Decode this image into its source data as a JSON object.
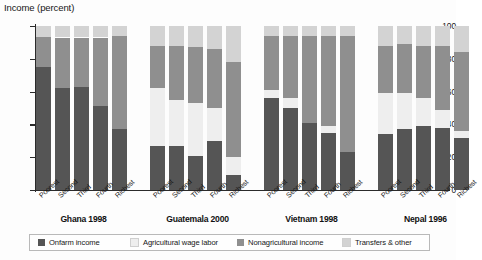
{
  "chart_data": {
    "type": "bar",
    "subtype": "stacked-bar-100pct-grouped",
    "title": "Income (percent)",
    "ylabel": "Income (percent)",
    "xlabel": "",
    "ylim": [
      0,
      100
    ],
    "yticks": [
      0,
      20,
      40,
      60,
      80,
      100
    ],
    "grid": false,
    "legend_position": "bottom",
    "categories": [
      "Poorest",
      "Second",
      "Third",
      "Fourth",
      "Richest"
    ],
    "series": [
      {
        "name": "Onfarm income",
        "color": "#555555"
      },
      {
        "name": "Agricultural wage labor",
        "color": "#eeeeee"
      },
      {
        "name": "Nonagricultural income",
        "color": "#8f8f8f"
      },
      {
        "name": "Transfers & other",
        "color": "#d3d3d3"
      }
    ],
    "groups": [
      {
        "name": "Ghana 1998",
        "bars": [
          {
            "category": "Poorest",
            "values": [
              75,
              0,
              18,
              7
            ]
          },
          {
            "category": "Second",
            "values": [
              62,
              0,
              31,
              7
            ]
          },
          {
            "category": "Third",
            "values": [
              63,
              0,
              30,
              7
            ]
          },
          {
            "category": "Fourth",
            "values": [
              51,
              0,
              42,
              7
            ]
          },
          {
            "category": "Richest",
            "values": [
              37,
              0,
              57,
              6
            ]
          }
        ]
      },
      {
        "name": "Guatemala 2000",
        "bars": [
          {
            "category": "Poorest",
            "values": [
              27,
              35,
              26,
              12
            ]
          },
          {
            "category": "Second",
            "values": [
              27,
              28,
              33,
              12
            ]
          },
          {
            "category": "Third",
            "values": [
              21,
              32,
              34,
              13
            ]
          },
          {
            "category": "Fourth",
            "values": [
              30,
              20,
              36,
              14
            ]
          },
          {
            "category": "Richest",
            "values": [
              9,
              11,
              58,
              22
            ]
          }
        ]
      },
      {
        "name": "Vietnam 1998",
        "bars": [
          {
            "category": "Poorest",
            "values": [
              56,
              5,
              33,
              6
            ]
          },
          {
            "category": "Second",
            "values": [
              50,
              6,
              38,
              6
            ]
          },
          {
            "category": "Third",
            "values": [
              41,
              0,
              53,
              6
            ]
          },
          {
            "category": "Fourth",
            "values": [
              35,
              4,
              55,
              6
            ]
          },
          {
            "category": "Richest",
            "values": [
              23,
              0,
              71,
              6
            ]
          }
        ]
      },
      {
        "name": "Nepal 1996",
        "bars": [
          {
            "category": "Poorest",
            "values": [
              34,
              25,
              29,
              12
            ]
          },
          {
            "category": "Second",
            "values": [
              37,
              22,
              30,
              11
            ]
          },
          {
            "category": "Third",
            "values": [
              39,
              17,
              32,
              12
            ]
          },
          {
            "category": "Fourth",
            "values": [
              38,
              11,
              39,
              12
            ]
          },
          {
            "category": "Richest",
            "values": [
              32,
              4,
              48,
              16
            ]
          }
        ]
      }
    ]
  }
}
